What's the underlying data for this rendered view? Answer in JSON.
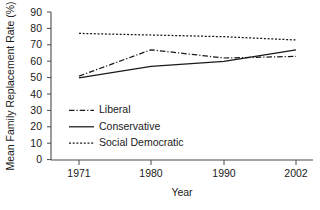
{
  "chart_data": {
    "type": "line",
    "title": "",
    "xlabel": "Year",
    "ylabel": "Mean Family Replacement Rate (%)",
    "x": [
      1971,
      1980,
      1990,
      2002
    ],
    "xticklabels": [
      "1971",
      "1980",
      "1990",
      "2002"
    ],
    "yticks": [
      0,
      10,
      20,
      30,
      40,
      50,
      60,
      70,
      80,
      90
    ],
    "yticklabels": [
      "0",
      "10",
      "20",
      "30",
      "40",
      "50",
      "60",
      "70",
      "80",
      "90"
    ],
    "ylim": [
      0,
      90
    ],
    "xlim": [
      1971,
      2002
    ],
    "grid": false,
    "legend_position": "lower-left-inside",
    "series": [
      {
        "name": "Liberal",
        "style": "dash-dot",
        "color": "#1a1a1a",
        "values": [
          51,
          67,
          62,
          63
        ]
      },
      {
        "name": "Conservative",
        "style": "solid",
        "color": "#1a1a1a",
        "values": [
          50,
          57,
          60,
          67
        ]
      },
      {
        "name": "Social Democratic",
        "style": "dotted",
        "color": "#1a1a1a",
        "values": [
          77,
          76,
          75,
          73
        ]
      }
    ]
  },
  "axes": {
    "y_title": "Mean Family Replacement Rate (%)",
    "x_title": "Year"
  },
  "legend": {
    "items": [
      {
        "label": "Liberal",
        "style": "dash-dot"
      },
      {
        "label": "Conservative",
        "style": "solid"
      },
      {
        "label": "Social Democratic",
        "style": "dotted"
      }
    ]
  },
  "colors": {
    "ink": "#1a1a1a",
    "axis": "#4a4a4a",
    "background": "#ffffff"
  }
}
